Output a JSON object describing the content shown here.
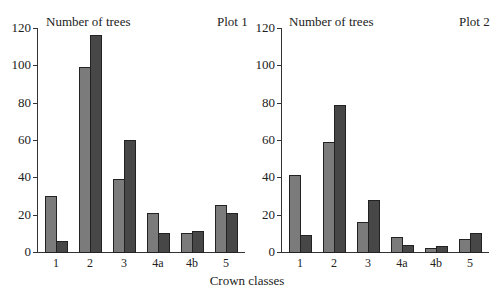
{
  "xlabel": "Crown classes",
  "colors": {
    "series1": "#7b7b7b",
    "series2": "#474747"
  },
  "chart_data": [
    {
      "type": "bar",
      "title": "Plot 1",
      "ylabel": "Number of trees",
      "xlabel": "Crown classes",
      "categories": [
        "1",
        "2",
        "3",
        "4a",
        "4b",
        "5"
      ],
      "series": [
        {
          "name": "Series 1 (light)",
          "values": [
            30,
            99,
            39,
            21,
            10,
            25
          ]
        },
        {
          "name": "Series 2 (dark)",
          "values": [
            6,
            116,
            60,
            10,
            11,
            21
          ]
        }
      ],
      "ylim": [
        0,
        120
      ],
      "yticks": [
        "0",
        "20",
        "40",
        "60",
        "80",
        "100",
        "120"
      ],
      "grid": false
    },
    {
      "type": "bar",
      "title": "Plot 2",
      "ylabel": "Number of trees",
      "xlabel": "Crown classes",
      "categories": [
        "1",
        "2",
        "3",
        "4a",
        "4b",
        "5"
      ],
      "series": [
        {
          "name": "Series 1 (light)",
          "values": [
            41,
            59,
            16,
            8,
            2,
            7
          ]
        },
        {
          "name": "Series 2 (dark)",
          "values": [
            9,
            79,
            28,
            4,
            3,
            10
          ]
        }
      ],
      "ylim": [
        0,
        120
      ],
      "yticks": [
        "0",
        "20",
        "40",
        "60",
        "80",
        "100",
        "120"
      ],
      "grid": false
    }
  ]
}
